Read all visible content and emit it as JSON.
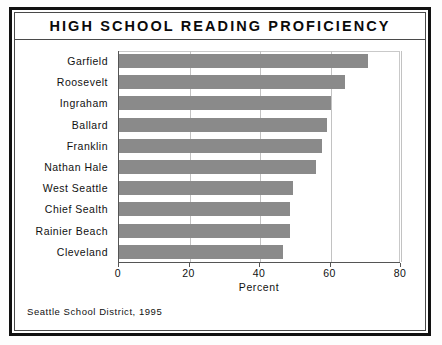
{
  "figure": {
    "title": "HIGH SCHOOL READING PROFICIENCY",
    "footnote": "Seattle School District, 1995"
  },
  "colors": {
    "bar_fill": "#8a8a8a",
    "frame": "#111111",
    "grid": "#c2c2c2",
    "text": "#111111"
  },
  "chart_data": {
    "type": "bar",
    "orientation": "horizontal",
    "title": "HIGH SCHOOL READING PROFICIENCY",
    "subtitle": "",
    "xlabel": "Percent",
    "ylabel": "",
    "xlim": [
      0,
      80
    ],
    "xticks": [
      0,
      20,
      40,
      60,
      80
    ],
    "xtick_labels": [
      "0",
      "20",
      "40",
      "60",
      "80"
    ],
    "grid": true,
    "legend": false,
    "annotation": "Seattle School District, 1995",
    "categories": [
      "Garfield",
      "Roosevelt",
      "Ingraham",
      "Ballard",
      "Franklin",
      "Nathan Hale",
      "West Seattle",
      "Chief Sealth",
      "Rainier Beach",
      "Cleveland"
    ],
    "values": [
      70.5,
      64,
      60,
      59,
      57.5,
      56,
      49.5,
      48.5,
      48.5,
      46.5
    ]
  }
}
